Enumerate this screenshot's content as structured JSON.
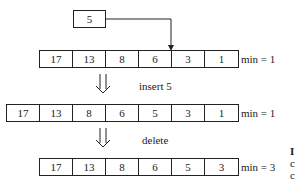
{
  "diagram": {
    "new_element": {
      "value": "5"
    },
    "rows": [
      {
        "cells": [
          "17",
          "13",
          "8",
          "6",
          "3",
          "1"
        ],
        "min_label": "min = 1"
      },
      {
        "cells": [
          "17",
          "13",
          "8",
          "6",
          "5",
          "3",
          "1"
        ],
        "min_label": "min = 1"
      },
      {
        "cells": [
          "17",
          "13",
          "8",
          "6",
          "5",
          "3"
        ],
        "min_label": "min = 3"
      }
    ],
    "transitions": [
      {
        "label": "insert 5"
      },
      {
        "label": "delete"
      }
    ],
    "clipped_edge_text": [
      "I",
      "c",
      "c"
    ]
  }
}
